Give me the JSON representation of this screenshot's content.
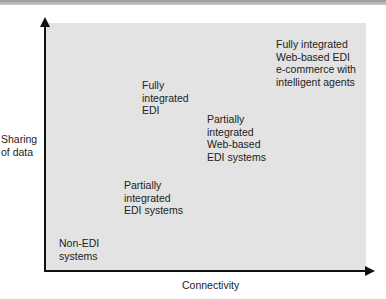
{
  "diagram": {
    "y_axis_label": "Sharing\nof data",
    "x_axis_label": "Connectivity",
    "nodes": [
      {
        "id": "non-edi",
        "label": "Non-EDI\nsystems"
      },
      {
        "id": "partially-integrated-edi",
        "label": "Partially\nintegrated\nEDI systems"
      },
      {
        "id": "fully-integrated-edi",
        "label": "Fully\nintegrated\nEDI"
      },
      {
        "id": "partially-integrated-web-edi",
        "label": "Partially\nintegrated\nWeb-based\nEDI systems"
      },
      {
        "id": "fully-integrated-web-edi-agents",
        "label": "Fully integrated\nWeb-based EDI\ne-commerce with\nintelligent agents"
      }
    ]
  },
  "colors": {
    "plot_background": "#e3e3e3",
    "axis": "#111111",
    "text": "#222222"
  }
}
